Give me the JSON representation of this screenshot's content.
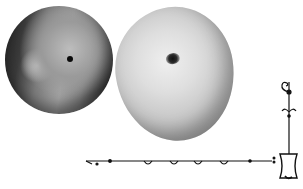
{
  "image": {
    "description": "Grayscale illustration of two apples with a decorative ornamental border line",
    "colors": {
      "background": "#ffffff",
      "dark_apple_shadow": "#1f1f1f",
      "light_apple_highlight": "#efefef",
      "ornament_ink": "#111111"
    },
    "objects": [
      {
        "name": "left apple",
        "tone": "dark"
      },
      {
        "name": "right apple",
        "tone": "light"
      },
      {
        "name": "ornamental line",
        "tone": "black ink"
      }
    ]
  }
}
